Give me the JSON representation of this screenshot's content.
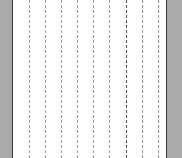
{
  "layout": {
    "left_panel_color": "#a9a9a9",
    "right_panel_color": "#a9a9a9",
    "border_color": "#3a3a3a",
    "canvas_color": "#ffffff"
  },
  "guides": [
    {
      "x": 29,
      "style": "light"
    },
    {
      "x": 45,
      "style": "light"
    },
    {
      "x": 61,
      "style": "light"
    },
    {
      "x": 77,
      "style": "light"
    },
    {
      "x": 93,
      "style": "light"
    },
    {
      "x": 109,
      "style": "light"
    },
    {
      "x": 126,
      "style": "strong"
    },
    {
      "x": 142,
      "style": "light"
    },
    {
      "x": 158,
      "style": "light"
    }
  ]
}
